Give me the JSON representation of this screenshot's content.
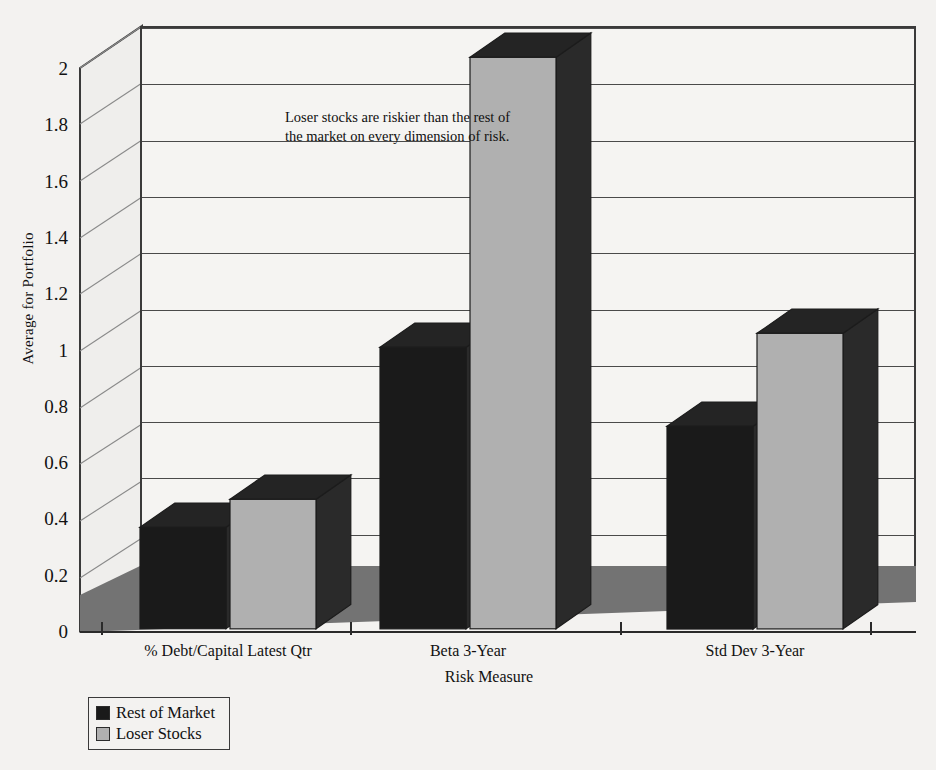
{
  "chart_data": {
    "type": "bar",
    "title": "",
    "subtitle": "",
    "xlabel": "Risk Measure",
    "ylabel": "Average for Portfolio",
    "categories": [
      "% Debt/Capital Latest Qtr",
      "Beta 3-Year",
      "Std Dev 3-Year"
    ],
    "series": [
      {
        "name": "Rest of Market",
        "color": "#1a1a1a",
        "values": [
          0.36,
          1.0,
          0.72
        ]
      },
      {
        "name": "Loser Stocks",
        "color": "#b0b0b0",
        "values": [
          0.46,
          2.03,
          1.05
        ]
      }
    ],
    "ylim": [
      0,
      2
    ],
    "yticks": [
      0,
      0.2,
      0.4,
      0.6,
      0.8,
      1,
      1.2,
      1.4,
      1.6,
      1.8,
      2
    ],
    "ytick_labels": [
      "0",
      "0.2",
      "0.4",
      "0.6",
      "0.8",
      "1",
      "1.2",
      "1.4",
      "1.6",
      "1.8",
      "2"
    ],
    "grid": true,
    "legend_position": "bottom-left",
    "annotations": [
      {
        "lines": [
          "Loser stocks are riskier than the rest of",
          "the market on every dimension of risk."
        ]
      }
    ],
    "style": "3d-bar",
    "colors": {
      "background": "#f3f2f0",
      "plot_background": "#f5f4f2",
      "floor": "#737373",
      "sidewall": "#efeeec",
      "axis": "#2a2a2a",
      "gridline": "#4a4a4a",
      "series_dark": "#1a1a1a",
      "series_dark_side": "#2a2a2a",
      "series_dark_top": "#242424",
      "series_light": "#b0b0b0",
      "series_light_side": "#2a2a2a",
      "series_light_top": "#242424"
    }
  },
  "legend": {
    "items": [
      {
        "label": "Rest of Market",
        "color": "#1a1a1a"
      },
      {
        "label": "Loser Stocks",
        "color": "#b0b0b0"
      }
    ]
  }
}
